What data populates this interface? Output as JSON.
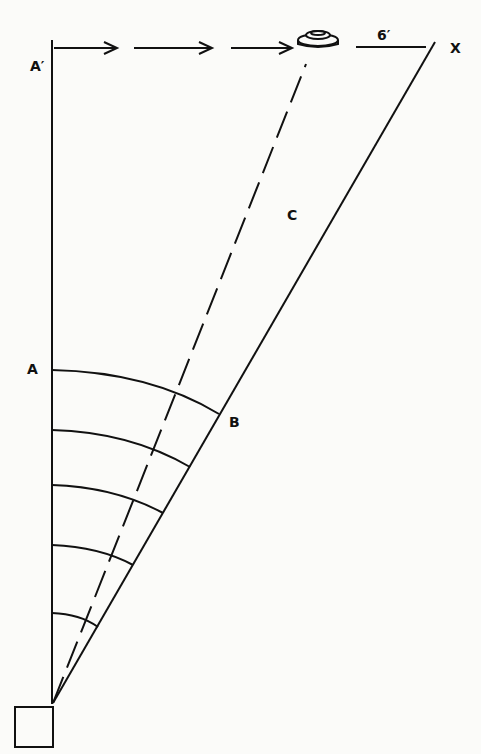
{
  "diagram": {
    "labels": {
      "a_prime": "A′",
      "a": "A",
      "b": "B",
      "c": "C",
      "x": "X",
      "distance": "6′"
    },
    "colors": {
      "ink": "#111111",
      "paper": "#fbfbf9"
    }
  }
}
